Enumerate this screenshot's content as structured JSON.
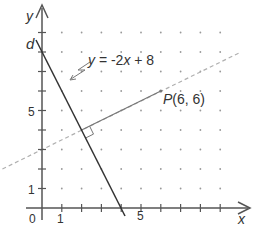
{
  "figure": {
    "axes": {
      "x_label": "x",
      "y_label": "y",
      "origin_label": "0",
      "x_tick_labels": [
        {
          "value": 1,
          "text": "1"
        },
        {
          "value": 5,
          "text": "5"
        }
      ],
      "y_tick_labels": [
        {
          "value": 1,
          "text": "1"
        },
        {
          "value": 5,
          "text": "5"
        }
      ],
      "x_range": [
        0,
        10
      ],
      "y_range": [
        0,
        9.5
      ]
    },
    "line_d": {
      "name": "d",
      "equation_label": "y = -2x + 8",
      "equation_parts": {
        "y": "y",
        "rest": " = -2",
        "x": "x",
        "tail": " + 8"
      }
    },
    "point": {
      "name": "P",
      "coords_text": "(6, 6)",
      "x": 6,
      "y": 6
    },
    "perpendicular": {
      "from": [
        6,
        6
      ],
      "foot": [
        2,
        4
      ],
      "extended_line": "y = 0.5x + 3",
      "right_angle_marker": true
    },
    "grid": {
      "type": "dot",
      "x_from": 1,
      "x_to": 9,
      "y_from": 1,
      "y_to": 9
    },
    "colors": {
      "axis": "#555555",
      "line_d": "#333333",
      "perpendicular": "#777777",
      "dashed": "#aaaaaa",
      "dots": "#999999"
    }
  }
}
